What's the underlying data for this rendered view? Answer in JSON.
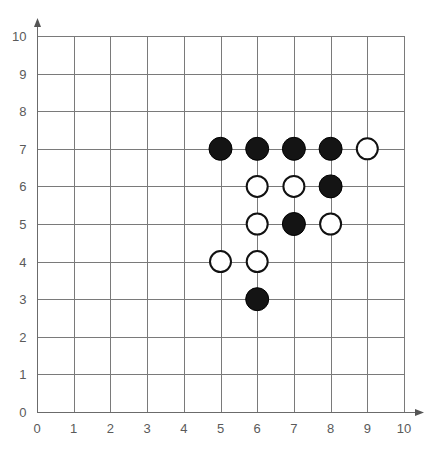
{
  "chart_data": {
    "type": "scatter",
    "title": "",
    "subtitle": "",
    "xlabel": "",
    "ylabel": "",
    "xlim": [
      0,
      10
    ],
    "ylim": [
      0,
      10
    ],
    "grid": true,
    "legend": "none",
    "x_ticks": [
      "0",
      "1",
      "2",
      "3",
      "4",
      "5",
      "6",
      "7",
      "8",
      "9",
      "10"
    ],
    "y_ticks": [
      "0",
      "1",
      "2",
      "3",
      "4",
      "5",
      "6",
      "7",
      "8",
      "9",
      "10"
    ],
    "x_tick_values": [
      0,
      1,
      2,
      3,
      4,
      5,
      6,
      7,
      8,
      9,
      10
    ],
    "y_tick_values": [
      0,
      1,
      2,
      3,
      4,
      5,
      6,
      7,
      8,
      9,
      10
    ],
    "series": [
      {
        "name": "black",
        "marker": "filled-circle",
        "color": "#141414",
        "points": [
          {
            "x": 5,
            "y": 7
          },
          {
            "x": 6,
            "y": 7
          },
          {
            "x": 7,
            "y": 7
          },
          {
            "x": 8,
            "y": 7
          },
          {
            "x": 8,
            "y": 6
          },
          {
            "x": 7,
            "y": 5
          },
          {
            "x": 6,
            "y": 3
          }
        ]
      },
      {
        "name": "white",
        "marker": "open-circle",
        "color": "#ffffff",
        "points": [
          {
            "x": 9,
            "y": 7
          },
          {
            "x": 6,
            "y": 6
          },
          {
            "x": 7,
            "y": 6
          },
          {
            "x": 6,
            "y": 5
          },
          {
            "x": 8,
            "y": 5
          },
          {
            "x": 5,
            "y": 4
          },
          {
            "x": 6,
            "y": 4
          }
        ]
      }
    ]
  },
  "colors": {
    "background": "#ffffff",
    "grid": "#7a7a7a",
    "axis": "#6b6b6b",
    "tick_text": "#5a5a5a",
    "black_stone": "#141414",
    "white_stone_fill": "#ffffff",
    "white_stone_stroke": "#111111"
  },
  "icons": {
    "x_axis_arrow": "arrow-right-icon",
    "y_axis_arrow": "arrow-up-icon"
  }
}
